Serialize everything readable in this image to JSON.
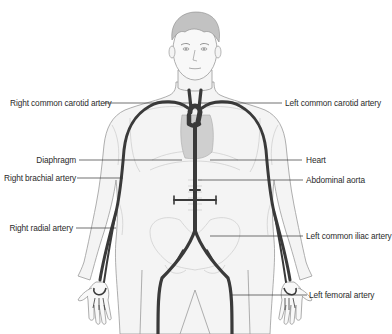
{
  "diagram": {
    "colors": {
      "artery": "#3a3a3a",
      "outline": "#9a9a9a",
      "heart": "#c8c8c8",
      "hair": "#b8b8b8",
      "leader_line": "#333333",
      "background": "#ffffff"
    },
    "labels_left": [
      {
        "id": "right-common-carotid-artery",
        "text": "Right common carotid artery"
      },
      {
        "id": "diaphragm",
        "text": "Diaphragm"
      },
      {
        "id": "right-brachial-artery",
        "text": "Right brachial artery"
      },
      {
        "id": "right-radial-artery",
        "text": "Right radial artery"
      }
    ],
    "labels_right": [
      {
        "id": "left-common-carotid-artery",
        "text": "Left common carotid artery"
      },
      {
        "id": "heart",
        "text": "Heart"
      },
      {
        "id": "abdominal-aorta",
        "text": "Abdominal aorta"
      },
      {
        "id": "left-common-iliac-artery",
        "text": "Left common iliac artery"
      },
      {
        "id": "left-femoral-artery",
        "text": "Left femoral artery"
      }
    ]
  }
}
